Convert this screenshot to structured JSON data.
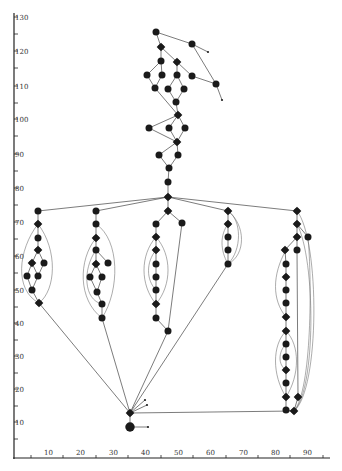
{
  "diagram": {
    "type": "directed-graph-on-axes",
    "colors": {
      "node": "#1a1a1a",
      "edge": "#444444",
      "axis": "#222222",
      "background": "#ffffff"
    },
    "y_axis": {
      "ticks": [
        {
          "label": "130",
          "y": 17
        },
        {
          "label": "120",
          "y": 51
        },
        {
          "label": "110",
          "y": 86
        },
        {
          "label": "100",
          "y": 119
        },
        {
          "label": "90",
          "y": 154
        },
        {
          "label": "80",
          "y": 188
        },
        {
          "label": "70",
          "y": 222
        },
        {
          "label": "60",
          "y": 256
        },
        {
          "label": "50",
          "y": 290
        },
        {
          "label": "40",
          "y": 323
        },
        {
          "label": "30",
          "y": 356
        },
        {
          "label": "20",
          "y": 389
        },
        {
          "label": "10",
          "y": 422
        }
      ]
    },
    "x_axis": {
      "ticks": [
        {
          "label": "10",
          "x": 49
        },
        {
          "label": "20",
          "x": 81
        },
        {
          "label": "30",
          "x": 114
        },
        {
          "label": "40",
          "x": 146
        },
        {
          "label": "50",
          "x": 179
        },
        {
          "label": "60",
          "x": 211
        },
        {
          "label": "70",
          "x": 244
        },
        {
          "label": "80",
          "x": 276
        },
        {
          "label": "90",
          "x": 308
        }
      ]
    },
    "nodes": [
      {
        "id": "t1",
        "x": 156,
        "y": 32,
        "shape": "circle"
      },
      {
        "id": "t2",
        "x": 192,
        "y": 44,
        "shape": "circle"
      },
      {
        "id": "t3",
        "x": 161,
        "y": 47,
        "shape": "diamond"
      },
      {
        "id": "t4",
        "x": 161,
        "y": 61,
        "shape": "circle"
      },
      {
        "id": "t5",
        "x": 177,
        "y": 62,
        "shape": "diamond"
      },
      {
        "id": "t6",
        "x": 147,
        "y": 75,
        "shape": "circle"
      },
      {
        "id": "t7",
        "x": 162,
        "y": 75,
        "shape": "circle"
      },
      {
        "id": "t8",
        "x": 177,
        "y": 75,
        "shape": "circle"
      },
      {
        "id": "t9",
        "x": 192,
        "y": 76,
        "shape": "circle"
      },
      {
        "id": "t10",
        "x": 216,
        "y": 84,
        "shape": "circle"
      },
      {
        "id": "t11",
        "x": 155,
        "y": 88,
        "shape": "circle"
      },
      {
        "id": "t12",
        "x": 168,
        "y": 89,
        "shape": "circle"
      },
      {
        "id": "t13",
        "x": 184,
        "y": 89,
        "shape": "circle"
      },
      {
        "id": "t14",
        "x": 176,
        "y": 102,
        "shape": "circle"
      },
      {
        "id": "m1",
        "x": 178,
        "y": 115,
        "shape": "diamond"
      },
      {
        "id": "m2",
        "x": 149,
        "y": 128,
        "shape": "circle"
      },
      {
        "id": "m3",
        "x": 169,
        "y": 128,
        "shape": "circle"
      },
      {
        "id": "m4",
        "x": 185,
        "y": 128,
        "shape": "circle"
      },
      {
        "id": "m5",
        "x": 177,
        "y": 142,
        "shape": "diamond"
      },
      {
        "id": "m6",
        "x": 159,
        "y": 155,
        "shape": "circle"
      },
      {
        "id": "m7",
        "x": 178,
        "y": 155,
        "shape": "circle"
      },
      {
        "id": "m8",
        "x": 169,
        "y": 168,
        "shape": "circle"
      },
      {
        "id": "m9",
        "x": 168,
        "y": 182,
        "shape": "circle"
      },
      {
        "id": "hub",
        "x": 168,
        "y": 197,
        "shape": "diamond"
      },
      {
        "id": "a1",
        "x": 38,
        "y": 211,
        "shape": "circle"
      },
      {
        "id": "a2",
        "x": 38,
        "y": 224,
        "shape": "diamond"
      },
      {
        "id": "a3",
        "x": 38,
        "y": 238,
        "shape": "circle"
      },
      {
        "id": "a4",
        "x": 38,
        "y": 250,
        "shape": "diamond"
      },
      {
        "id": "a5",
        "x": 32,
        "y": 263,
        "shape": "diamond"
      },
      {
        "id": "a6",
        "x": 44,
        "y": 263,
        "shape": "circle"
      },
      {
        "id": "a7",
        "x": 27,
        "y": 276,
        "shape": "circle"
      },
      {
        "id": "a8",
        "x": 38,
        "y": 276,
        "shape": "circle"
      },
      {
        "id": "a9",
        "x": 32,
        "y": 290,
        "shape": "circle"
      },
      {
        "id": "a10",
        "x": 39,
        "y": 303,
        "shape": "diamond"
      },
      {
        "id": "b1",
        "x": 96,
        "y": 211,
        "shape": "circle"
      },
      {
        "id": "b2",
        "x": 96,
        "y": 224,
        "shape": "circle"
      },
      {
        "id": "b3",
        "x": 96,
        "y": 238,
        "shape": "diamond"
      },
      {
        "id": "b4",
        "x": 96,
        "y": 250,
        "shape": "circle"
      },
      {
        "id": "b5",
        "x": 96,
        "y": 264,
        "shape": "diamond"
      },
      {
        "id": "b6",
        "x": 108,
        "y": 263,
        "shape": "circle"
      },
      {
        "id": "b7",
        "x": 90,
        "y": 277,
        "shape": "circle"
      },
      {
        "id": "b8",
        "x": 102,
        "y": 277,
        "shape": "circle"
      },
      {
        "id": "b9",
        "x": 97,
        "y": 292,
        "shape": "circle"
      },
      {
        "id": "b10",
        "x": 102,
        "y": 304,
        "shape": "circle"
      },
      {
        "id": "b11",
        "x": 102,
        "y": 318,
        "shape": "circle"
      },
      {
        "id": "c1",
        "x": 168,
        "y": 211,
        "shape": "diamond"
      },
      {
        "id": "c2",
        "x": 156,
        "y": 224,
        "shape": "circle"
      },
      {
        "id": "c3",
        "x": 182,
        "y": 223,
        "shape": "circle"
      },
      {
        "id": "c4",
        "x": 156,
        "y": 237,
        "shape": "diamond"
      },
      {
        "id": "c5",
        "x": 156,
        "y": 250,
        "shape": "diamond"
      },
      {
        "id": "c6",
        "x": 156,
        "y": 264,
        "shape": "circle"
      },
      {
        "id": "c7",
        "x": 156,
        "y": 277,
        "shape": "circle"
      },
      {
        "id": "c8",
        "x": 156,
        "y": 290,
        "shape": "circle"
      },
      {
        "id": "c9",
        "x": 156,
        "y": 304,
        "shape": "diamond"
      },
      {
        "id": "c10",
        "x": 156,
        "y": 318,
        "shape": "circle"
      },
      {
        "id": "c11",
        "x": 168,
        "y": 331,
        "shape": "circle"
      },
      {
        "id": "d1",
        "x": 228,
        "y": 211,
        "shape": "diamond"
      },
      {
        "id": "d2",
        "x": 228,
        "y": 224,
        "shape": "diamond"
      },
      {
        "id": "d3",
        "x": 228,
        "y": 237,
        "shape": "circle"
      },
      {
        "id": "d4",
        "x": 228,
        "y": 250,
        "shape": "circle"
      },
      {
        "id": "d5",
        "x": 228,
        "y": 264,
        "shape": "circle"
      },
      {
        "id": "e1",
        "x": 297,
        "y": 211,
        "shape": "diamond"
      },
      {
        "id": "e2",
        "x": 297,
        "y": 224,
        "shape": "diamond"
      },
      {
        "id": "e3",
        "x": 297,
        "y": 237,
        "shape": "diamond"
      },
      {
        "id": "e4",
        "x": 308,
        "y": 237,
        "shape": "circle"
      },
      {
        "id": "e5",
        "x": 285,
        "y": 250,
        "shape": "diamond"
      },
      {
        "id": "e6",
        "x": 297,
        "y": 250,
        "shape": "circle"
      },
      {
        "id": "e7",
        "x": 286,
        "y": 264,
        "shape": "circle"
      },
      {
        "id": "e8",
        "x": 286,
        "y": 277,
        "shape": "diamond"
      },
      {
        "id": "e9",
        "x": 286,
        "y": 290,
        "shape": "circle"
      },
      {
        "id": "e10",
        "x": 286,
        "y": 303,
        "shape": "circle"
      },
      {
        "id": "e11",
        "x": 286,
        "y": 317,
        "shape": "diamond"
      },
      {
        "id": "e12",
        "x": 286,
        "y": 331,
        "shape": "diamond"
      },
      {
        "id": "e13",
        "x": 286,
        "y": 344,
        "shape": "circle"
      },
      {
        "id": "e14",
        "x": 286,
        "y": 357,
        "shape": "circle"
      },
      {
        "id": "e15",
        "x": 286,
        "y": 370,
        "shape": "diamond"
      },
      {
        "id": "e16",
        "x": 286,
        "y": 383,
        "shape": "circle"
      },
      {
        "id": "e17",
        "x": 286,
        "y": 397,
        "shape": "diamond"
      },
      {
        "id": "e18",
        "x": 286,
        "y": 410,
        "shape": "circle"
      },
      {
        "id": "e19",
        "x": 298,
        "y": 397,
        "shape": "diamond"
      },
      {
        "id": "e20",
        "x": 294,
        "y": 411,
        "shape": "diamond"
      },
      {
        "id": "z1",
        "x": 130,
        "y": 413,
        "shape": "diamond"
      },
      {
        "id": "z2",
        "x": 130,
        "y": 427,
        "shape": "circle"
      }
    ],
    "edges": [
      [
        "t1",
        "t2"
      ],
      [
        "t1",
        "t3"
      ],
      [
        "t3",
        "t4"
      ],
      [
        "t3",
        "t5"
      ],
      [
        "t4",
        "t6"
      ],
      [
        "t4",
        "t7"
      ],
      [
        "t5",
        "t8"
      ],
      [
        "t5",
        "t9"
      ],
      [
        "t2",
        "t10"
      ],
      [
        "t9",
        "t10"
      ],
      [
        "t6",
        "t11"
      ],
      [
        "t7",
        "t11"
      ],
      [
        "t8",
        "t12"
      ],
      [
        "t8",
        "t13"
      ],
      [
        "t12",
        "t14"
      ],
      [
        "t13",
        "t14"
      ],
      [
        "t11",
        "m1"
      ],
      [
        "t14",
        "m1"
      ],
      [
        "m1",
        "m2"
      ],
      [
        "m1",
        "m3"
      ],
      [
        "m1",
        "m4"
      ],
      [
        "m2",
        "m5"
      ],
      [
        "m3",
        "m5"
      ],
      [
        "m4",
        "m5"
      ],
      [
        "m5",
        "m6"
      ],
      [
        "m5",
        "m7"
      ],
      [
        "m6",
        "m8"
      ],
      [
        "m7",
        "m8"
      ],
      [
        "m8",
        "m9"
      ],
      [
        "m9",
        "hub"
      ],
      [
        "hub",
        "a1"
      ],
      [
        "hub",
        "b1"
      ],
      [
        "hub",
        "c1"
      ],
      [
        "hub",
        "d1"
      ],
      [
        "hub",
        "e1"
      ],
      [
        "a1",
        "a2"
      ],
      [
        "a2",
        "a3"
      ],
      [
        "a3",
        "a4"
      ],
      [
        "a4",
        "a5"
      ],
      [
        "a4",
        "a6"
      ],
      [
        "a5",
        "a7"
      ],
      [
        "a5",
        "a8"
      ],
      [
        "a6",
        "a8"
      ],
      [
        "a7",
        "a9"
      ],
      [
        "a8",
        "a9"
      ],
      [
        "a9",
        "a10"
      ],
      [
        "b1",
        "b2"
      ],
      [
        "b2",
        "b3"
      ],
      [
        "b3",
        "b4"
      ],
      [
        "b4",
        "b5"
      ],
      [
        "b4",
        "b6"
      ],
      [
        "b5",
        "b7"
      ],
      [
        "b5",
        "b8"
      ],
      [
        "b7",
        "b9"
      ],
      [
        "b8",
        "b9"
      ],
      [
        "b9",
        "b10"
      ],
      [
        "b10",
        "b11"
      ],
      [
        "c1",
        "c2"
      ],
      [
        "c1",
        "c3"
      ],
      [
        "c2",
        "c4"
      ],
      [
        "c4",
        "c5"
      ],
      [
        "c5",
        "c6"
      ],
      [
        "c6",
        "c7"
      ],
      [
        "c7",
        "c8"
      ],
      [
        "c8",
        "c9"
      ],
      [
        "c9",
        "c10"
      ],
      [
        "c10",
        "c11"
      ],
      [
        "c3",
        "c11"
      ],
      [
        "d1",
        "d2"
      ],
      [
        "d2",
        "d3"
      ],
      [
        "d3",
        "d4"
      ],
      [
        "d4",
        "d5"
      ],
      [
        "e1",
        "e2"
      ],
      [
        "e2",
        "e3"
      ],
      [
        "e2",
        "e4"
      ],
      [
        "e3",
        "e5"
      ],
      [
        "e3",
        "e6"
      ],
      [
        "e5",
        "e7"
      ],
      [
        "e7",
        "e8"
      ],
      [
        "e8",
        "e9"
      ],
      [
        "e9",
        "e10"
      ],
      [
        "e10",
        "e11"
      ],
      [
        "e11",
        "e12"
      ],
      [
        "e12",
        "e13"
      ],
      [
        "e13",
        "e14"
      ],
      [
        "e14",
        "e15"
      ],
      [
        "e15",
        "e16"
      ],
      [
        "e16",
        "e17"
      ],
      [
        "e17",
        "e18"
      ],
      [
        "e18",
        "e20"
      ],
      [
        "e19",
        "e20"
      ],
      [
        "e6",
        "e19"
      ],
      [
        "a10",
        "z1"
      ],
      [
        "b11",
        "z1"
      ],
      [
        "c11",
        "z1"
      ],
      [
        "d5",
        "z1"
      ],
      [
        "z1",
        "e20"
      ],
      [
        "z1",
        "z2"
      ]
    ],
    "arrow_ends": [
      {
        "from": "t2",
        "x": 208,
        "y": 52
      },
      {
        "from": "t10",
        "x": 222,
        "y": 100
      },
      {
        "from": "z1",
        "x": 145,
        "y": 400
      },
      {
        "from": "z1",
        "x": 147,
        "y": 405
      },
      {
        "from": "z2",
        "x": 148,
        "y": 427
      }
    ]
  }
}
